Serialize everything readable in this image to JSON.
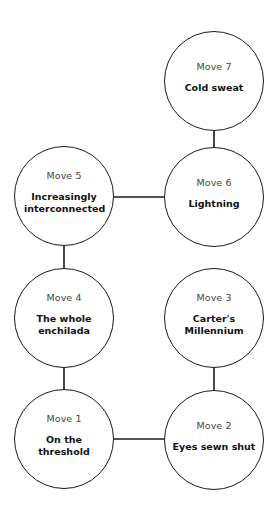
{
  "diagram": {
    "type": "move-sequence",
    "nodes": [
      {
        "id": "move-1",
        "label": "Move 1",
        "name": "On the threshold",
        "cx": 64,
        "cy": 439
      },
      {
        "id": "move-2",
        "label": "Move 2",
        "name": "Eyes sewn shut",
        "cx": 214,
        "cy": 440
      },
      {
        "id": "move-3",
        "label": "Move 3",
        "name": "Carter's Millennium",
        "cx": 214,
        "cy": 318
      },
      {
        "id": "move-4",
        "label": "Move 4",
        "name": "The whole enchilada",
        "cx": 64,
        "cy": 318
      },
      {
        "id": "move-5",
        "label": "Move 5",
        "name": "Increasingly interconnected",
        "cx": 64,
        "cy": 196
      },
      {
        "id": "move-6",
        "label": "Move 6",
        "name": "Lightning",
        "cx": 214,
        "cy": 197
      },
      {
        "id": "move-7",
        "label": "Move 7",
        "name": "Cold sweat",
        "cx": 214,
        "cy": 81
      }
    ],
    "edges": [
      [
        "move-1",
        "move-2"
      ],
      [
        "move-2",
        "move-3"
      ],
      [
        "move-1",
        "move-4"
      ],
      [
        "move-4",
        "move-5"
      ],
      [
        "move-5",
        "move-6"
      ],
      [
        "move-6",
        "move-7"
      ]
    ],
    "line_color": "#1a1a1a"
  }
}
